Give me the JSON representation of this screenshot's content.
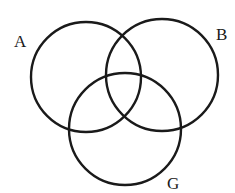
{
  "diagram": {
    "type": "venn",
    "stroke_color": "#1a1a1a",
    "background": "#ffffff",
    "circles": [
      {
        "label": "A",
        "cx": 86,
        "cy": 77,
        "r": 55
      },
      {
        "label": "B",
        "cx": 162,
        "cy": 75,
        "r": 56
      },
      {
        "label": "G",
        "cx": 125,
        "cy": 129,
        "r": 56
      }
    ],
    "labels": {
      "a": "A",
      "b": "B",
      "g": "G"
    }
  }
}
